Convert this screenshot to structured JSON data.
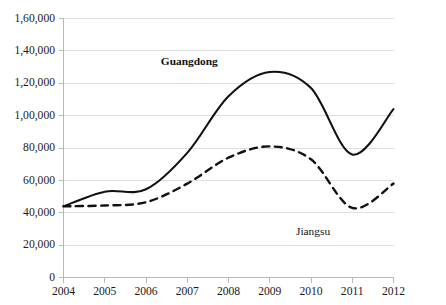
{
  "chart_data": {
    "type": "line",
    "title": "",
    "subtitle": "",
    "xlabel": "",
    "ylabel": "",
    "x": [
      2004,
      2005,
      2006,
      2007,
      2008,
      2009,
      2010,
      2011,
      2012
    ],
    "categories": [
      "2004",
      "2005",
      "2006",
      "2007",
      "2008",
      "2009",
      "2010",
      "2011",
      "2012"
    ],
    "xtick_labels": [
      "2004",
      "2005",
      "2006",
      "2007",
      "2008",
      "2009",
      "2010",
      "2011",
      "2012"
    ],
    "ytick_labels": [
      "0",
      "20,000",
      "40,000",
      "60,000",
      "80,000",
      "1,00,000",
      "1,20,000",
      "1,40,000",
      "1,60,000"
    ],
    "ytick_values": [
      0,
      20000,
      40000,
      60000,
      80000,
      100000,
      120000,
      140000,
      160000
    ],
    "ylim": [
      0,
      160000
    ],
    "xlim": [
      2004,
      2012
    ],
    "grid": true,
    "grid_axis": "y",
    "legend_position": "inline-annotation",
    "series": [
      {
        "name": "Guangdong",
        "label": "Guangdong",
        "style": "solid",
        "color": "#111111",
        "bold_label": true,
        "label_x": 2007.05,
        "label_y": 131000,
        "values": [
          44000,
          53000,
          54500,
          77000,
          112000,
          127000,
          117000,
          76000,
          104000
        ]
      },
      {
        "name": "Jiangsu",
        "label": "Jiangsu",
        "style": "dashed",
        "color": "#111111",
        "bold_label": false,
        "label_x": 2010.05,
        "label_y": 26500,
        "values": [
          44000,
          44500,
          46500,
          58000,
          74000,
          81000,
          73000,
          43000,
          58000
        ]
      }
    ]
  },
  "axes": {
    "y_axis_name": "y-axis",
    "x_axis_name": "x-axis"
  }
}
